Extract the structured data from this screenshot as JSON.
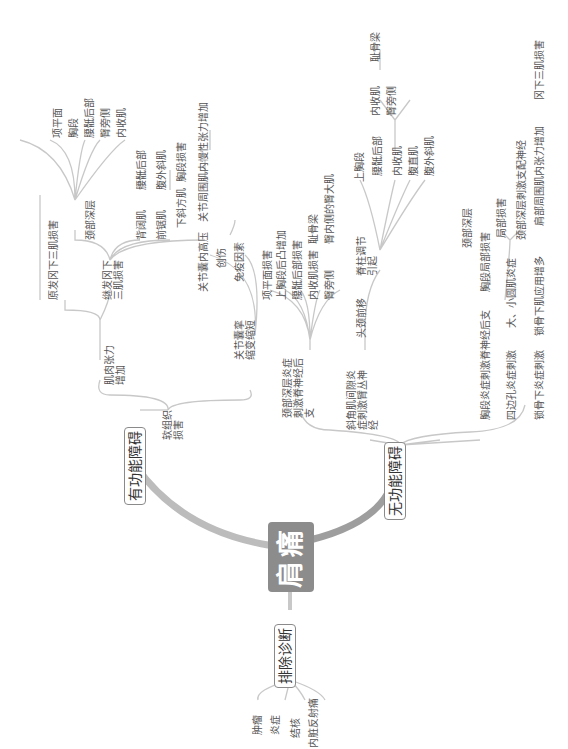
{
  "root": {
    "label": "肩痛"
  },
  "branches": {
    "exclusion": {
      "label": "排除诊断",
      "items": [
        "肿瘤",
        "炎症",
        "结核",
        "内脏反射痛"
      ]
    },
    "functional": {
      "label": "有功能障碍",
      "soft_tissue": "软组织损害",
      "muscle_tension": "肌肉张力增加",
      "primary": "原发冈下三肌损害",
      "secondary": "继发冈下三肌损害",
      "deep_neck": "颈部深层",
      "deep_neck_items": [
        "项平面",
        "胸段",
        "腰骶后部",
        "臀旁侧",
        "内收肌"
      ],
      "latissimus": "背阔肌",
      "latissimus_target": "腰骶后部",
      "serratus": "前锯肌",
      "serratus_target": "腹外斜肌",
      "lower_trapezius": "下斜方肌",
      "lower_trapezius_target": "胸段损害",
      "capsule": "关节囊挛缩变缩短",
      "capsule_pressure": "关节囊内高压",
      "capsule_pressure_target": "关节周围肌内慢性张力增加",
      "trauma": "创伤",
      "immune": "免疫因素"
    },
    "non_functional": {
      "label": "无功能障碍",
      "deep_neck_inflam": "颈部深层炎症刺激脊神经后支",
      "deep_neck_inflam_items": [
        "项平面损害",
        "上胸段后凸增加",
        "腰骶后部损害",
        "内收肌损害",
        "臀旁侧"
      ],
      "adductor_target": "耻骨梁",
      "gluteal_target": "臀内侧的臀大肌",
      "scalene": "斜角肌间隙炎症刺激臂丛神经",
      "head_forward": "头颈前移",
      "spine_adjust": "脊柱调节引起",
      "spine_upper": "上胸段",
      "spine_lumbosacral": "腰骶后部",
      "spine_lumbo_items": [
        "内收肌",
        "臀旁侧"
      ],
      "spine_adductor_target": "耻骨梁",
      "spine_items": [
        "内收肌",
        "腹直肌",
        "腹外斜肌"
      ],
      "deep_neck2": "颈部深层",
      "thoracic": "胸段炎症刺激脊神经后支",
      "thoracic_target": "胸段局部损害",
      "quadrilateral": "四边孔炎症刺激",
      "teres": "大、小圆肌炎症",
      "teres_items": [
        "局部损害",
        "颈部深层刺激支配神经"
      ],
      "subclavian": "锁骨下炎症刺激",
      "subclavian_target": "锁骨下肌应用增多",
      "subclavian_target2": "肩部周围肌内张力增加",
      "subclavian_target3": "冈下三肌损害"
    }
  },
  "colors": {
    "root": "#8c8c8c",
    "line": "#bdbdbd",
    "thick": "#a8a8a8"
  }
}
